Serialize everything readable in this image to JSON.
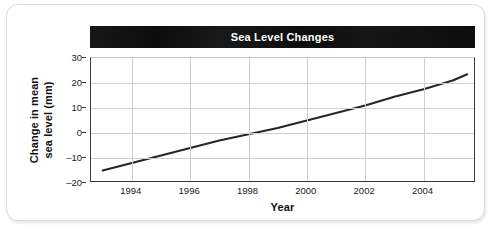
{
  "chart_data": {
    "type": "line",
    "title": "Sea Level Changes",
    "xlabel": "Year",
    "ylabel_line1": "Change in mean",
    "ylabel_line2": "sea level (mm)",
    "xlim": [
      1992.6,
      1005.8
    ],
    "x_axis_min": 1992.6,
    "x_axis_max": 2005.8,
    "ylim": [
      -20,
      30
    ],
    "y_ticks": [
      30,
      20,
      10,
      0,
      -10,
      -20
    ],
    "y_tick_labels": [
      "30",
      "20",
      "10",
      "0",
      "–10",
      "–20"
    ],
    "x_ticks": [
      1994,
      1996,
      1998,
      2000,
      2002,
      2004
    ],
    "x_tick_labels": [
      "1994",
      "1996",
      "1998",
      "2000",
      "2002",
      "2004"
    ],
    "grid": true,
    "legend": "none",
    "series": [
      {
        "name": "Change in mean sea level",
        "color": "#262626",
        "x": [
          1993.0,
          1994.0,
          1995.0,
          1996.0,
          1997.0,
          1998.0,
          1999.0,
          2000.0,
          2001.0,
          2002.0,
          2003.0,
          2004.0,
          2005.0,
          2005.5
        ],
        "values": [
          -15.0,
          -12.0,
          -9.0,
          -6.0,
          -3.0,
          -0.5,
          2.0,
          5.0,
          8.0,
          11.0,
          14.5,
          17.5,
          21.0,
          23.5
        ]
      }
    ],
    "annotations": []
  },
  "figure": {
    "title_banner_color": "#0d0d0d",
    "title_text_color": "#ffffff",
    "grid_color": "#cfcfcf",
    "axis_color": "#3a3a3a",
    "line_color": "#262626",
    "card_background": "#ffffff",
    "card_border_color": "#dcdcdc"
  }
}
